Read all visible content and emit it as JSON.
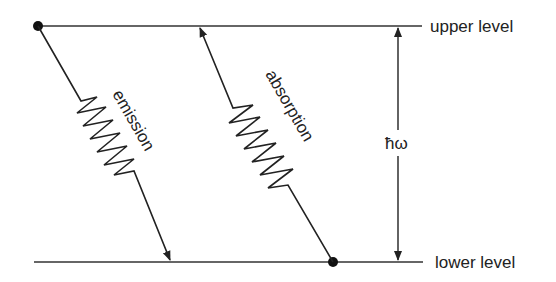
{
  "diagram": {
    "title": "",
    "levels": {
      "upper": {
        "label": "upper level"
      },
      "lower": {
        "label": "lower level"
      }
    },
    "transitions": {
      "emission": {
        "label": "emission",
        "direction": "upper-to-lower"
      },
      "absorption": {
        "label": "absorption",
        "direction": "lower-to-upper"
      }
    },
    "energy_gap": {
      "label": "ħω"
    },
    "colors": {
      "ink": "#222222",
      "background": "#ffffff"
    }
  }
}
